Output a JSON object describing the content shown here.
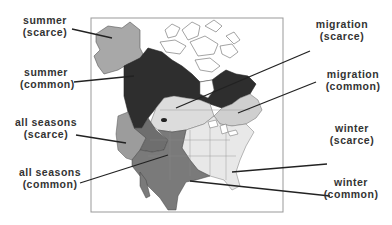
{
  "figure": {
    "type": "range map"
  },
  "colors": {
    "summer_scarce": "#a8a8a8",
    "summer_common": "#2e2e2e",
    "migration_scarce": "#d9d9d9",
    "migration_common": "#cfcfcf",
    "all_seasons_scarce": "#9a9a9a",
    "all_seasons_common": "#6e6e6e",
    "winter_scarce": "#e6e6e6",
    "winter_common": "#7a7a7a",
    "outline": "#555555",
    "frame": "#999999",
    "leader": "#222222"
  },
  "labels": {
    "summer_scarce": {
      "line1": "summer",
      "line2": "(scarce)"
    },
    "summer_common": {
      "line1": "summer",
      "line2": "(common)"
    },
    "all_seasons_scarce": {
      "line1": "all seasons",
      "line2": "(scarce)"
    },
    "all_seasons_common": {
      "line1": "all seasons",
      "line2": "(common)"
    },
    "migration_scarce": {
      "line1": "migration",
      "line2": "(scarce)"
    },
    "migration_common": {
      "line1": "migration",
      "line2": "(common)"
    },
    "winter_scarce": {
      "line1": "winter",
      "line2": "(scarce)"
    },
    "winter_common": {
      "line1": "winter",
      "line2": "(common)"
    }
  }
}
